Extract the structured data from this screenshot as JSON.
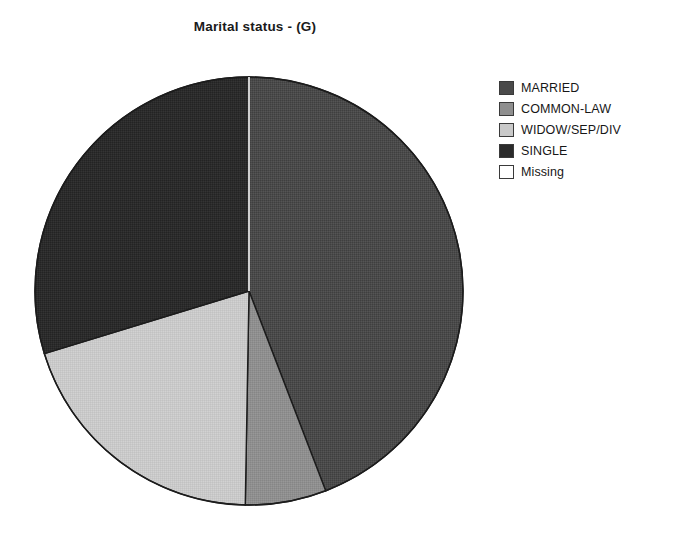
{
  "chart_data": {
    "type": "pie",
    "title": "Marital status - (G)",
    "subtitle": "",
    "xlabel": "",
    "ylabel": "",
    "grid": false,
    "legend_position": "right",
    "start_angle_deg": 0,
    "direction": "clockwise",
    "categories": [
      "MARRIED",
      "COMMON-LAW",
      "WIDOW/SEP/DIV",
      "SINGLE",
      "Missing"
    ],
    "values": [
      44.2,
      6.1,
      20.0,
      29.7,
      0.0
    ],
    "value_unit": "percent",
    "slice_angles_deg": [
      159.0,
      22.0,
      72.0,
      107.0,
      0.0
    ],
    "slice_boundaries_deg": [
      0,
      159,
      181,
      253,
      360,
      360
    ],
    "colors": [
      "#4a4a4a",
      "#8f8f8f",
      "#c9c9c9",
      "#2b2b2b",
      "#ffffff"
    ],
    "slice_edge_color": "#1c1c1c",
    "slices": [
      {
        "label": "MARRIED",
        "value": 44.2,
        "color": "#4a4a4a",
        "start_deg": 0,
        "end_deg": 159
      },
      {
        "label": "COMMON-LAW",
        "value": 6.1,
        "color": "#8f8f8f",
        "start_deg": 159,
        "end_deg": 181
      },
      {
        "label": "WIDOW/SEP/DIV",
        "value": 20.0,
        "color": "#c9c9c9",
        "start_deg": 181,
        "end_deg": 253
      },
      {
        "label": "SINGLE",
        "value": 29.7,
        "color": "#2b2b2b",
        "start_deg": 253,
        "end_deg": 360
      },
      {
        "label": "Missing",
        "value": 0.0,
        "color": "#ffffff",
        "start_deg": 360,
        "end_deg": 360
      }
    ]
  },
  "legend": {
    "items": [
      {
        "label": "MARRIED",
        "color": "#4a4a4a"
      },
      {
        "label": "COMMON-LAW",
        "color": "#8f8f8f"
      },
      {
        "label": "WIDOW/SEP/DIV",
        "color": "#c9c9c9"
      },
      {
        "label": "SINGLE",
        "color": "#2b2b2b"
      },
      {
        "label": "Missing",
        "color": "#ffffff"
      }
    ]
  }
}
